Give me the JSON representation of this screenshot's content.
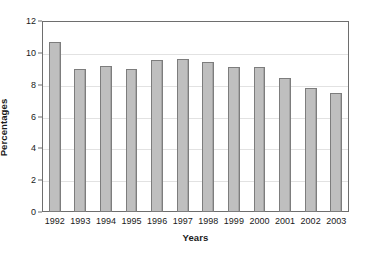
{
  "chart_data": {
    "type": "bar",
    "title": "",
    "xlabel": "Years",
    "ylabel": "Percentages",
    "categories": [
      "1992",
      "1993",
      "1994",
      "1995",
      "1996",
      "1997",
      "1998",
      "1999",
      "2000",
      "2001",
      "2002",
      "2003"
    ],
    "values": [
      10.7,
      9.0,
      9.2,
      9.0,
      9.55,
      9.6,
      9.4,
      9.1,
      9.1,
      8.45,
      7.8,
      7.5
    ],
    "series": [
      {
        "name": "Percentages",
        "values": [
          10.7,
          9.0,
          9.2,
          9.0,
          9.55,
          9.6,
          9.4,
          9.1,
          9.1,
          8.45,
          7.8,
          7.5
        ]
      }
    ],
    "ylim": [
      0,
      12
    ],
    "ytick_values": [
      0,
      2,
      4,
      6,
      8,
      10,
      12
    ],
    "ytick_labels": [
      "0",
      "2",
      "4",
      "6",
      "8",
      "10",
      "12"
    ],
    "grid": "horizontal",
    "legend": "none",
    "bar_fill_color": "#bfbfbf",
    "bar_border_color": "#7d7d7d",
    "gridline_color": "#e2e2e2",
    "axis_color": "#6e6e6e",
    "background_color": "#ffffff"
  }
}
